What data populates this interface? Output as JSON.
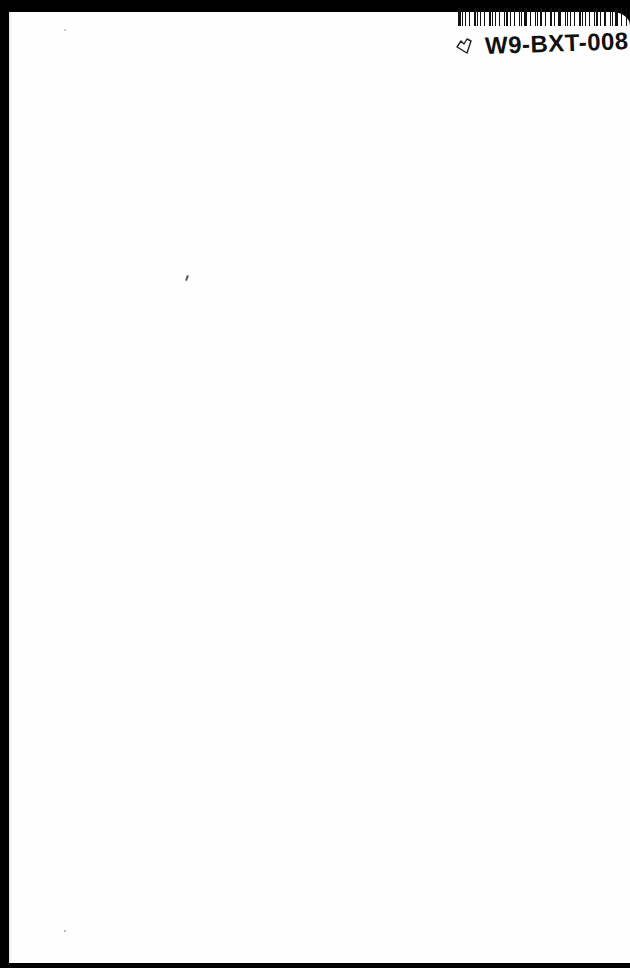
{
  "document": {
    "type": "blank book page scan",
    "label": {
      "code": "W9-BXT-008",
      "barcode_bars": [
        3,
        1,
        2,
        1,
        3,
        1,
        1,
        2,
        3,
        1,
        2,
        1,
        1,
        3,
        2,
        1,
        1,
        2,
        3,
        1,
        2,
        1,
        3,
        1,
        1,
        2,
        1,
        3,
        2,
        1,
        1,
        2,
        3,
        1,
        2,
        1,
        1,
        3,
        1,
        2,
        2,
        1,
        3,
        1,
        2
      ],
      "icon": "tag-heart-icon"
    },
    "colors": {
      "page": "#fefefe",
      "background": "#000000",
      "ink": "#111111"
    }
  }
}
